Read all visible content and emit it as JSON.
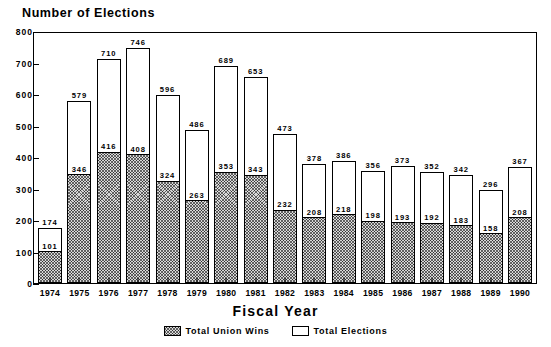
{
  "chart_data": {
    "type": "bar",
    "title": "",
    "xlabel": "Fiscal Year",
    "ylabel": "Number of Elections",
    "ylim": [
      0,
      800
    ],
    "ytick_step": 100,
    "yticks": [
      "800",
      "700",
      "600",
      "500",
      "400",
      "300",
      "200",
      "100",
      "0"
    ],
    "grid": false,
    "legend_position": "bottom-center",
    "stacked_overlay": true,
    "categories": [
      "1974",
      "1975",
      "1976",
      "1977",
      "1978",
      "1979",
      "1980",
      "1981",
      "1982",
      "1983",
      "1984",
      "1985",
      "1986",
      "1987",
      "1988",
      "1989",
      "1990"
    ],
    "series": [
      {
        "name": "Total Elections",
        "style": "white",
        "values": [
          174,
          579,
          710,
          746,
          596,
          486,
          689,
          653,
          473,
          378,
          386,
          356,
          373,
          352,
          342,
          296,
          367
        ]
      },
      {
        "name": "Total Union Wins",
        "style": "hatched",
        "values": [
          101,
          346,
          416,
          408,
          324,
          263,
          353,
          343,
          232,
          208,
          218,
          198,
          193,
          192,
          183,
          158,
          208
        ]
      }
    ]
  },
  "legend": {
    "items": [
      {
        "label": "Total Union Wins",
        "style": "hatched"
      },
      {
        "label": "Total Elections",
        "style": "white"
      }
    ]
  }
}
